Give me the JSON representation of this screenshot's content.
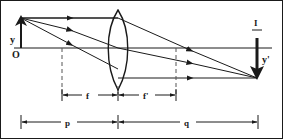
{
  "figure": {
    "colors": {
      "ink": "#1a1a1a",
      "background": "#ffffff",
      "dashed": "#555555"
    },
    "labels": {
      "object_height": "y",
      "origin": "O",
      "image_marker": "I",
      "image_height": "y'",
      "focal_left": "f",
      "focal_right": "f'",
      "object_distance": "p",
      "image_distance": "q"
    },
    "geometry": {
      "axis_y": 48,
      "lens_center_x": 118,
      "lens_top_y": 10,
      "lens_bottom_y": 90,
      "object_x": 21,
      "object_top_y": 18,
      "image_x": 257,
      "image_bottom_y": 78,
      "focal_left_x": 62,
      "focal_right_x": 176,
      "dim_f_y": 95,
      "dim_pq_y": 122
    }
  }
}
